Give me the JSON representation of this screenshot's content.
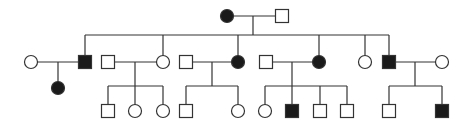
{
  "diagram": {
    "type": "pedigree",
    "colors": {
      "line": "#333333",
      "affected_fill": "#1a1a1a",
      "unaffected_fill": "#ffffff"
    },
    "symbol_size": 13,
    "individuals": [
      {
        "id": "I-1",
        "generation": 1,
        "sex": "female",
        "affected": true,
        "x": 227,
        "y": 16
      },
      {
        "id": "I-2",
        "generation": 1,
        "sex": "male",
        "affected": false,
        "x": 282,
        "y": 16
      },
      {
        "id": "II-1",
        "generation": 2,
        "sex": "female",
        "affected": false,
        "x": 31,
        "y": 62
      },
      {
        "id": "II-2",
        "generation": 2,
        "sex": "male",
        "affected": true,
        "x": 85,
        "y": 62
      },
      {
        "id": "II-3",
        "generation": 2,
        "sex": "male",
        "affected": false,
        "x": 108,
        "y": 62
      },
      {
        "id": "II-4",
        "generation": 2,
        "sex": "female",
        "affected": false,
        "x": 163,
        "y": 62
      },
      {
        "id": "II-5",
        "generation": 2,
        "sex": "male",
        "affected": false,
        "x": 186,
        "y": 62
      },
      {
        "id": "II-6",
        "generation": 2,
        "sex": "female",
        "affected": true,
        "x": 238,
        "y": 62
      },
      {
        "id": "II-7",
        "generation": 2,
        "sex": "male",
        "affected": false,
        "x": 266,
        "y": 62
      },
      {
        "id": "II-8",
        "generation": 2,
        "sex": "female",
        "affected": true,
        "x": 319,
        "y": 62
      },
      {
        "id": "II-9",
        "generation": 2,
        "sex": "female",
        "affected": false,
        "x": 365,
        "y": 62
      },
      {
        "id": "II-10",
        "generation": 2,
        "sex": "male",
        "affected": true,
        "x": 389,
        "y": 62
      },
      {
        "id": "II-11",
        "generation": 2,
        "sex": "female",
        "affected": false,
        "x": 442,
        "y": 62
      },
      {
        "id": "III-1",
        "generation": 3,
        "sex": "female",
        "affected": true,
        "x": 58,
        "y": 88
      },
      {
        "id": "III-2",
        "generation": 3,
        "sex": "male",
        "affected": false,
        "x": 108,
        "y": 111
      },
      {
        "id": "III-3",
        "generation": 3,
        "sex": "female",
        "affected": false,
        "x": 135,
        "y": 111
      },
      {
        "id": "III-4",
        "generation": 3,
        "sex": "female",
        "affected": false,
        "x": 163,
        "y": 111
      },
      {
        "id": "III-5",
        "generation": 3,
        "sex": "male",
        "affected": false,
        "x": 186,
        "y": 111
      },
      {
        "id": "III-6",
        "generation": 3,
        "sex": "female",
        "affected": false,
        "x": 238,
        "y": 111
      },
      {
        "id": "III-7",
        "generation": 3,
        "sex": "female",
        "affected": false,
        "x": 265,
        "y": 111
      },
      {
        "id": "III-8",
        "generation": 3,
        "sex": "male",
        "affected": true,
        "x": 292,
        "y": 111
      },
      {
        "id": "III-9",
        "generation": 3,
        "sex": "male",
        "affected": false,
        "x": 320,
        "y": 111
      },
      {
        "id": "III-10",
        "generation": 3,
        "sex": "male",
        "affected": false,
        "x": 347,
        "y": 111
      },
      {
        "id": "III-11",
        "generation": 3,
        "sex": "male",
        "affected": false,
        "x": 389,
        "y": 111
      },
      {
        "id": "III-12",
        "generation": 3,
        "sex": "male",
        "affected": true,
        "x": 442,
        "y": 111
      }
    ],
    "lines": [
      {
        "kind": "marriage",
        "x1": 233,
        "y1": 16,
        "x2": 276,
        "y2": 16
      },
      {
        "kind": "descent",
        "x1": 253,
        "y1": 16,
        "x2": 253,
        "y2": 35
      },
      {
        "kind": "sibship",
        "x1": 85,
        "y1": 35,
        "x2": 389,
        "y2": 35
      },
      {
        "kind": "drop",
        "x1": 85,
        "y1": 35,
        "x2": 85,
        "y2": 56
      },
      {
        "kind": "drop",
        "x1": 163,
        "y1": 35,
        "x2": 163,
        "y2": 56
      },
      {
        "kind": "drop",
        "x1": 238,
        "y1": 35,
        "x2": 238,
        "y2": 56
      },
      {
        "kind": "drop",
        "x1": 319,
        "y1": 35,
        "x2": 319,
        "y2": 56
      },
      {
        "kind": "drop",
        "x1": 365,
        "y1": 35,
        "x2": 365,
        "y2": 56
      },
      {
        "kind": "drop",
        "x1": 389,
        "y1": 35,
        "x2": 389,
        "y2": 56
      },
      {
        "kind": "marriage",
        "x1": 37,
        "y1": 62,
        "x2": 79,
        "y2": 62
      },
      {
        "kind": "descent",
        "x1": 58,
        "y1": 62,
        "x2": 58,
        "y2": 82
      },
      {
        "kind": "marriage",
        "x1": 114,
        "y1": 62,
        "x2": 157,
        "y2": 62
      },
      {
        "kind": "descent",
        "x1": 135,
        "y1": 62,
        "x2": 135,
        "y2": 86
      },
      {
        "kind": "sibship",
        "x1": 108,
        "y1": 86,
        "x2": 163,
        "y2": 86
      },
      {
        "kind": "drop",
        "x1": 108,
        "y1": 86,
        "x2": 108,
        "y2": 105
      },
      {
        "kind": "drop",
        "x1": 135,
        "y1": 86,
        "x2": 135,
        "y2": 105
      },
      {
        "kind": "drop",
        "x1": 163,
        "y1": 86,
        "x2": 163,
        "y2": 105
      },
      {
        "kind": "marriage",
        "x1": 192,
        "y1": 62,
        "x2": 232,
        "y2": 62
      },
      {
        "kind": "descent",
        "x1": 212,
        "y1": 62,
        "x2": 212,
        "y2": 86
      },
      {
        "kind": "sibship",
        "x1": 186,
        "y1": 86,
        "x2": 238,
        "y2": 86
      },
      {
        "kind": "drop",
        "x1": 186,
        "y1": 86,
        "x2": 186,
        "y2": 105
      },
      {
        "kind": "drop",
        "x1": 238,
        "y1": 86,
        "x2": 238,
        "y2": 105
      },
      {
        "kind": "marriage",
        "x1": 272,
        "y1": 62,
        "x2": 313,
        "y2": 62
      },
      {
        "kind": "descent",
        "x1": 292,
        "y1": 62,
        "x2": 292,
        "y2": 86
      },
      {
        "kind": "sibship",
        "x1": 265,
        "y1": 86,
        "x2": 347,
        "y2": 86
      },
      {
        "kind": "drop",
        "x1": 265,
        "y1": 86,
        "x2": 265,
        "y2": 105
      },
      {
        "kind": "drop",
        "x1": 292,
        "y1": 86,
        "x2": 292,
        "y2": 105
      },
      {
        "kind": "drop",
        "x1": 320,
        "y1": 86,
        "x2": 320,
        "y2": 105
      },
      {
        "kind": "drop",
        "x1": 347,
        "y1": 86,
        "x2": 347,
        "y2": 105
      },
      {
        "kind": "marriage",
        "x1": 395,
        "y1": 62,
        "x2": 436,
        "y2": 62
      },
      {
        "kind": "descent",
        "x1": 415,
        "y1": 62,
        "x2": 415,
        "y2": 86
      },
      {
        "kind": "sibship",
        "x1": 389,
        "y1": 86,
        "x2": 442,
        "y2": 86
      },
      {
        "kind": "drop",
        "x1": 389,
        "y1": 86,
        "x2": 389,
        "y2": 105
      },
      {
        "kind": "drop",
        "x1": 442,
        "y1": 86,
        "x2": 442,
        "y2": 105
      }
    ]
  }
}
